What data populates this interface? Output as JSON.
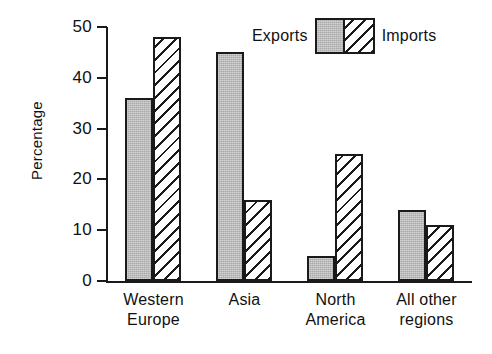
{
  "chart_data": {
    "type": "bar",
    "title": "",
    "subtitle": "",
    "xlabel": "",
    "ylabel": "Percentage",
    "ylim": [
      0,
      50
    ],
    "yticks": [
      0,
      10,
      20,
      30,
      40,
      50
    ],
    "ytick_labels": [
      "0",
      "10",
      "20",
      "30",
      "40",
      "50"
    ],
    "grid": false,
    "legend_position": "top-right",
    "categories": [
      "Western Europe",
      "Asia",
      "North America",
      "All other regions"
    ],
    "category_lines": [
      [
        "Western",
        "Europe"
      ],
      [
        "Asia",
        ""
      ],
      [
        "North",
        "America"
      ],
      [
        "All other",
        "regions"
      ]
    ],
    "series": [
      {
        "name": "Exports",
        "fill": "solid-gray",
        "color": "#a9a9a9",
        "values": [
          36,
          45,
          5,
          14
        ]
      },
      {
        "name": "Imports",
        "fill": "diagonal-hatch",
        "color": "#ffffff",
        "values": [
          48,
          16,
          25,
          11
        ]
      }
    ]
  },
  "legend": {
    "left_label": "Exports",
    "right_label": "Imports"
  },
  "axis": {
    "y_title": "Percentage"
  }
}
